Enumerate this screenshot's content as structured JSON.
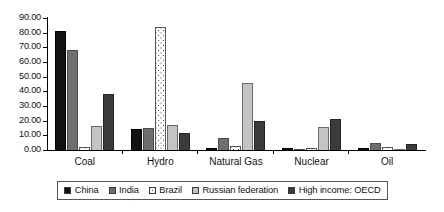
{
  "chart_data": {
    "type": "bar",
    "title": "",
    "subtitle": "",
    "xlabel": "",
    "ylabel": "",
    "ylim": [
      0,
      90
    ],
    "ytick_step": 10,
    "grid": false,
    "legend_position": "bottom",
    "value_format": "0.00",
    "categories": [
      "Coal",
      "Hydro",
      "Natural Gas",
      "Nuclear",
      "Oil"
    ],
    "ticks": [
      "0.00",
      "10.00",
      "20.00",
      "30.00",
      "40.00",
      "50.00",
      "60.00",
      "70.00",
      "80.00",
      "90.00"
    ],
    "series": [
      {
        "name": "China",
        "key": "china",
        "color": "#121212",
        "fill": "solid-black",
        "values": [
          81.0,
          14.5,
          1.5,
          1.5,
          1.5
        ]
      },
      {
        "name": "India",
        "key": "india",
        "color": "#6e6e6e",
        "fill": "solid-dark-gray",
        "values": [
          68.0,
          15.0,
          8.0,
          1.0,
          5.0
        ]
      },
      {
        "name": "Brazil",
        "key": "brazil",
        "color": "#ffffff",
        "fill": "dotted-white",
        "values": [
          2.0,
          84.0,
          3.0,
          1.5,
          2.0
        ]
      },
      {
        "name": "Russian federation",
        "key": "russia",
        "color": "#c4c4c4",
        "fill": "solid-light-gray",
        "values": [
          16.5,
          17.0,
          46.0,
          16.0,
          1.0
        ]
      },
      {
        "name": "High income: OECD",
        "key": "oecd",
        "color": "#3b3b3b",
        "fill": "solid-charcoal",
        "values": [
          38.0,
          11.5,
          20.0,
          21.0,
          4.0
        ]
      }
    ]
  }
}
